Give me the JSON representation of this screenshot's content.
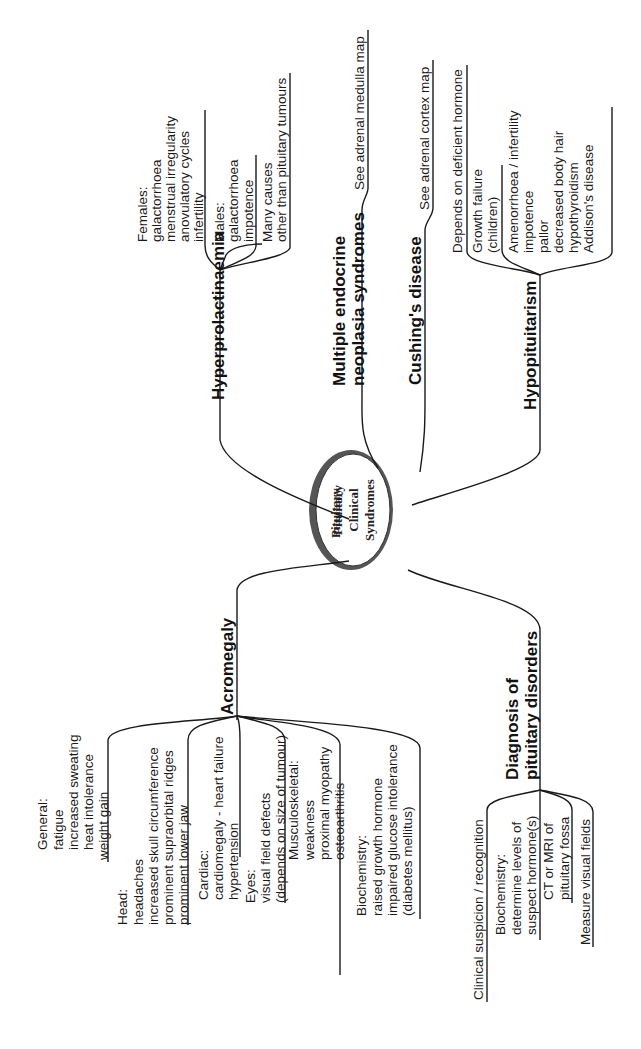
{
  "center": {
    "lines": [
      "Pituitary",
      "Clinical",
      "Syndromes"
    ]
  },
  "branches": {
    "hyperprolactinaemia": {
      "title": "Hyperprolactinaemia",
      "females": [
        "Females:",
        "galactorrhoea",
        "menstrual irregularity",
        "anovulatory cycles",
        "infertility"
      ],
      "males": [
        "Males:",
        "galactorrhoea",
        "impotence"
      ],
      "causes": [
        "Many causes",
        "other than pituitary tumours"
      ]
    },
    "men": {
      "title": [
        "Multiple endocrine",
        "neoplasia syndromes"
      ],
      "note": "See adrenal medulla map"
    },
    "cushings": {
      "title": "Cushing's disease",
      "note": "See adrenal cortex map"
    },
    "hypopituitarism": {
      "title": "Hypopituitarism",
      "depends": "Depends on deficient hormone",
      "growth": [
        "Growth failure",
        "(children)"
      ],
      "other": [
        "Amenorrhoea / infertility",
        "impotence",
        "pallor",
        "decreased body hair",
        "hypothyroidism",
        "Addison's disease"
      ]
    },
    "acromegaly": {
      "title": "Acromegaly",
      "general": [
        "General:",
        "fatigue",
        "increased sweating",
        "heat intolerance",
        "weight gain"
      ],
      "head": [
        "Head:",
        "headaches",
        "increased skull circumference",
        "prominent supraorbital ridges",
        "prominent lower jaw"
      ],
      "cardiac": [
        "Cardiac:",
        "cardiomegaly - heart failure",
        "hypertension"
      ],
      "eyes": [
        "Eyes:",
        "visual field defects",
        "(depends on size of tumour)"
      ],
      "musculoskeletal": [
        "Musculoskeletal:",
        "weakness",
        "proximal myopathy",
        "osteoarthritis"
      ],
      "biochemistry": [
        "Biochemistry:",
        "raised growth hormone",
        "impaired glucose intolerance",
        "(diabetes mellitus)"
      ]
    },
    "diagnosis": {
      "title": [
        "Diagnosis of",
        "pituitary disorders"
      ],
      "clinical": "Clinical suspicion / recognition",
      "biochem": [
        "Biochemistry:",
        "determine levels of",
        "suspect hormone(s)"
      ],
      "imaging": [
        "CT or MRI of",
        "pituitary fossa"
      ],
      "visual": "Measure visual fields"
    }
  }
}
